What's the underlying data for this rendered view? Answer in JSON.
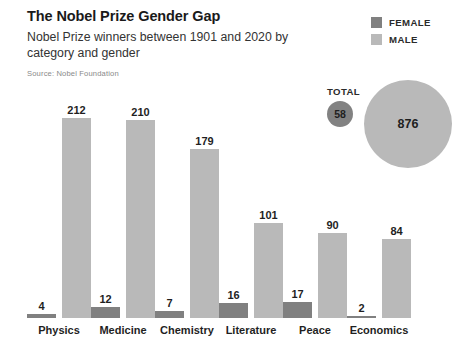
{
  "header": {
    "title": "The Nobel Prize Gender Gap",
    "subtitle": "Nobel Prize winners between 1901 and 2020 by category and gender",
    "source": "Source: Nobel Foundation"
  },
  "legend": {
    "items": [
      {
        "label": "FEMALE",
        "color": "#808080"
      },
      {
        "label": "MALE",
        "color": "#b9b9b9"
      }
    ]
  },
  "totals": {
    "label": "TOTAL",
    "female": "58",
    "male": "876"
  },
  "colors": {
    "female": "#808080",
    "male": "#b9b9b9",
    "text": "#1f1f1f",
    "muted": "#8a8a8a",
    "background": "#ffffff"
  },
  "chart_data": {
    "type": "bar",
    "title": "The Nobel Prize Gender Gap",
    "subtitle": "Nobel Prize winners between 1901 and 2020 by category and gender",
    "xlabel": "",
    "ylabel": "",
    "ylim": [
      0,
      212
    ],
    "grid": false,
    "legend_position": "top-right",
    "categories": [
      "Physics",
      "Medicine",
      "Chemistry",
      "Literature",
      "Peace",
      "Economics"
    ],
    "series": [
      {
        "name": "FEMALE",
        "color": "#808080",
        "values": [
          4,
          12,
          7,
          16,
          17,
          2
        ]
      },
      {
        "name": "MALE",
        "color": "#b9b9b9",
        "values": [
          212,
          210,
          179,
          101,
          90,
          84
        ]
      }
    ],
    "totals": {
      "FEMALE": 58,
      "MALE": 876
    },
    "annotations": [
      "Source: Nobel Foundation"
    ]
  }
}
